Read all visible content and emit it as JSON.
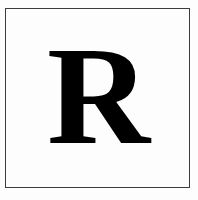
{
  "image": {
    "kind": "letterform-plate",
    "description": "Framed specimen plate showing a single serif capital letter",
    "width": 198,
    "height": 200
  },
  "frame": {
    "name": "border-rule",
    "style": "single thin rule",
    "color": "#3c3c3c",
    "background": "#ffffff",
    "inset_left": 5,
    "inset_top": 8,
    "inset_right": 8,
    "inset_bottom": 12
  },
  "glyph": {
    "character": "R",
    "case": "uppercase",
    "typeface_style": "serif",
    "weight": "bold",
    "color": "#000000",
    "cap_height_px": 98,
    "advance_width_px": 99,
    "features": "bracketed serifs, closed bowl, splayed leg with flat serif foot"
  },
  "colors": {
    "ink": "#000000",
    "rule": "#3c3c3c",
    "paper": "#fdfdfd"
  }
}
